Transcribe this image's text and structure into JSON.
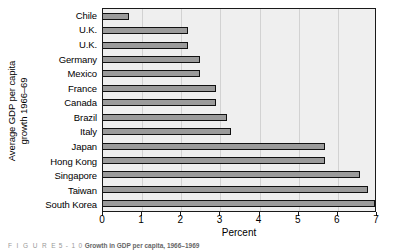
{
  "chart_data": {
    "type": "bar",
    "orientation": "horizontal",
    "title": "",
    "xlabel": "Percent",
    "ylabel": "Average GDP per capita growth 1966–69",
    "ylabel_line1": "Average GDP per capita",
    "ylabel_line2": "growth 1966–69",
    "xlim": [
      0,
      7
    ],
    "xticks": [
      0,
      1,
      2,
      3,
      4,
      5,
      6,
      7
    ],
    "xticklabels": [
      "0",
      "1",
      "2",
      "3",
      "4",
      "5",
      "6",
      "7"
    ],
    "grid": "vertical",
    "legend": "none",
    "categories": [
      "Chile",
      "U.K.",
      "U.K.",
      "Germany",
      "Mexico",
      "France",
      "Canada",
      "Brazil",
      "Italy",
      "Japan",
      "Hong Kong",
      "Singapore",
      "Taiwan",
      "South Korea"
    ],
    "values": [
      0.7,
      2.2,
      2.2,
      2.5,
      2.5,
      2.9,
      2.9,
      3.2,
      3.3,
      5.7,
      5.7,
      6.6,
      6.8,
      7.0
    ],
    "bar_fill_color": "#9b9b9b",
    "bar_edge_color": "#111111",
    "plot_background_color": "#efefef",
    "gridline_color": "#d2d2d2"
  },
  "caption": {
    "figure_word": "F I G U R E",
    "figure_number": "5 - 1 0",
    "title": "Growth in GDP per capita, 1966–1969"
  }
}
